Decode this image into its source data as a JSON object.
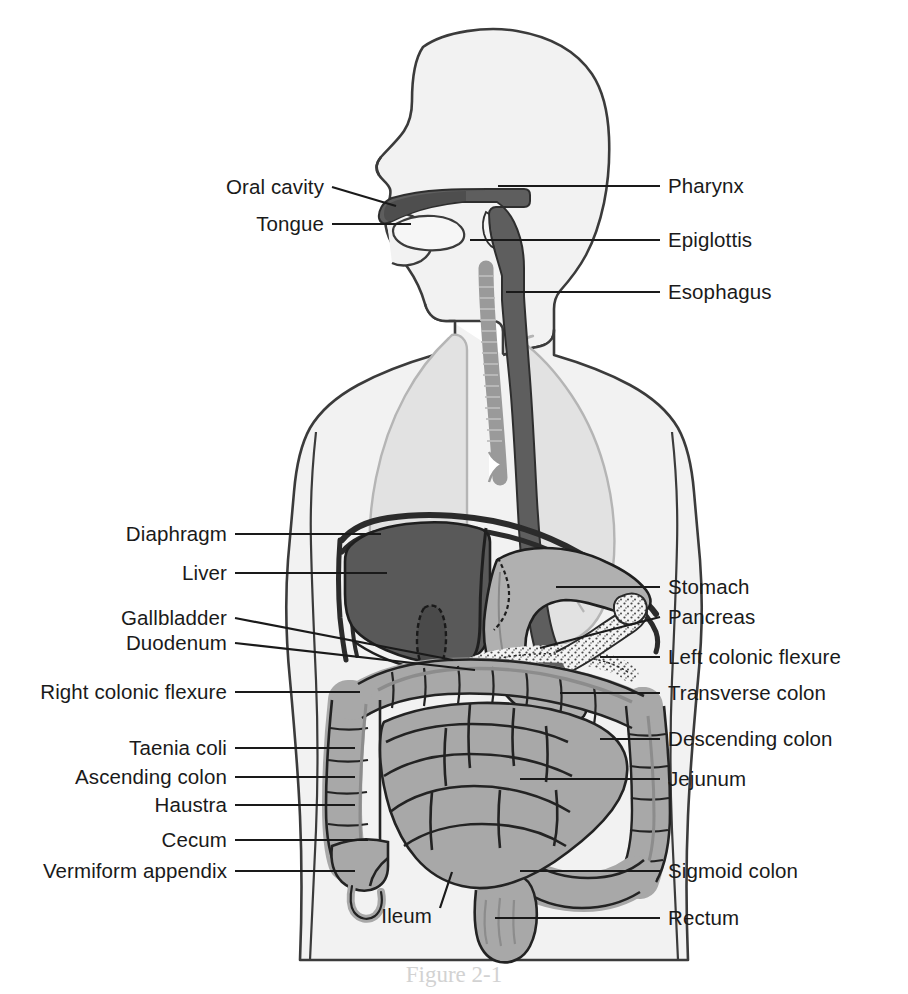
{
  "figure": {
    "caption": "Figure 2-1",
    "colors": {
      "body_fill": "#f2f2f2",
      "body_outline": "#3b3b3b",
      "lung_fill": "#e2e2e2",
      "lung_outline": "#b5b5b5",
      "pharynx_esophagus": "#5e5e5e",
      "liver": "#595959",
      "stomach": "#b0b0b0",
      "intestine": "#a8a8a8",
      "pancreas": "#f0f0f0",
      "leader_line": "#1a1a1a",
      "label_text": "#1a1a1a"
    }
  },
  "labels_left": [
    {
      "id": "oral-cavity",
      "text": "Oral cavity",
      "x": 324,
      "y": 187,
      "tx": 396,
      "ty": 206
    },
    {
      "id": "tongue",
      "text": "Tongue",
      "x": 324,
      "y": 224,
      "tx": 411,
      "ty": 224
    },
    {
      "id": "diaphragm",
      "text": "Diaphragm",
      "x": 227,
      "y": 534,
      "tx": 381,
      "ty": 534
    },
    {
      "id": "liver",
      "text": "Liver",
      "x": 227,
      "y": 573,
      "tx": 387,
      "ty": 573
    },
    {
      "id": "gallbladder",
      "text": "Gallbladder",
      "x": 227,
      "y": 618,
      "tx": 453,
      "ty": 660
    },
    {
      "id": "duodenum",
      "text": "Duodenum",
      "x": 227,
      "y": 643,
      "tx": 475,
      "ty": 670
    },
    {
      "id": "right-colonic-flexure",
      "text": "Right colonic flexure",
      "x": 227,
      "y": 692,
      "tx": 360,
      "ty": 692
    },
    {
      "id": "taenia-coli",
      "text": "Taenia coli",
      "x": 227,
      "y": 748,
      "tx": 355,
      "ty": 748
    },
    {
      "id": "ascending-colon",
      "text": "Ascending colon",
      "x": 227,
      "y": 777,
      "tx": 355,
      "ty": 777
    },
    {
      "id": "haustra",
      "text": "Haustra",
      "x": 227,
      "y": 805,
      "tx": 355,
      "ty": 805
    },
    {
      "id": "cecum",
      "text": "Cecum",
      "x": 227,
      "y": 840,
      "tx": 368,
      "ty": 840
    },
    {
      "id": "vermiform-appendix",
      "text": "Vermiform appendix",
      "x": 227,
      "y": 871,
      "tx": 355,
      "ty": 871
    },
    {
      "id": "ileum",
      "text": "Ileum",
      "x": 432,
      "y": 916,
      "tx": 452,
      "ty": 872
    }
  ],
  "labels_right": [
    {
      "id": "pharynx",
      "text": "Pharynx",
      "x": 668,
      "y": 186,
      "tx": 498,
      "ty": 186
    },
    {
      "id": "epiglottis",
      "text": "Epiglottis",
      "x": 668,
      "y": 240,
      "tx": 470,
      "ty": 240
    },
    {
      "id": "esophagus",
      "text": "Esophagus",
      "x": 668,
      "y": 292,
      "tx": 506,
      "ty": 292
    },
    {
      "id": "stomach",
      "text": "Stomach",
      "x": 668,
      "y": 587,
      "tx": 556,
      "ty": 587
    },
    {
      "id": "pancreas",
      "text": "Pancreas",
      "x": 668,
      "y": 617,
      "tx": 540,
      "ty": 648
    },
    {
      "id": "left-colonic-flexure",
      "text": "Left colonic flexure",
      "x": 668,
      "y": 657,
      "tx": 600,
      "ty": 657
    },
    {
      "id": "transverse-colon",
      "text": "Transverse colon",
      "x": 668,
      "y": 693,
      "tx": 560,
      "ty": 693
    },
    {
      "id": "descending-colon",
      "text": "Descending colon",
      "x": 668,
      "y": 739,
      "tx": 600,
      "ty": 739
    },
    {
      "id": "jejunum",
      "text": "Jejunum",
      "x": 668,
      "y": 779,
      "tx": 520,
      "ty": 779
    },
    {
      "id": "sigmoid-colon",
      "text": "Sigmoid colon",
      "x": 668,
      "y": 871,
      "tx": 520,
      "ty": 871
    },
    {
      "id": "rectum",
      "text": "Rectum",
      "x": 668,
      "y": 918,
      "tx": 495,
      "ty": 918
    }
  ],
  "organs": [
    {
      "id": "head",
      "name": "Head and neck silhouette"
    },
    {
      "id": "torso",
      "name": "Torso silhouette"
    },
    {
      "id": "lung-right",
      "name": "Right lung"
    },
    {
      "id": "lung-left",
      "name": "Left lung"
    },
    {
      "id": "trachea",
      "name": "Trachea"
    },
    {
      "id": "oral-cavity-organ",
      "name": "Oral cavity"
    },
    {
      "id": "tongue-organ",
      "name": "Tongue"
    },
    {
      "id": "pharynx-organ",
      "name": "Pharynx"
    },
    {
      "id": "epiglottis-organ",
      "name": "Epiglottis"
    },
    {
      "id": "esophagus-organ",
      "name": "Esophagus"
    },
    {
      "id": "diaphragm-organ",
      "name": "Diaphragm"
    },
    {
      "id": "liver-organ",
      "name": "Liver"
    },
    {
      "id": "gallbladder-organ",
      "name": "Gallbladder"
    },
    {
      "id": "stomach-organ",
      "name": "Stomach"
    },
    {
      "id": "duodenum-organ",
      "name": "Duodenum"
    },
    {
      "id": "pancreas-organ",
      "name": "Pancreas"
    },
    {
      "id": "colon-organ",
      "name": "Large intestine (colon)"
    },
    {
      "id": "small-intestine",
      "name": "Small intestine"
    },
    {
      "id": "cecum-organ",
      "name": "Cecum"
    },
    {
      "id": "appendix-organ",
      "name": "Vermiform appendix"
    },
    {
      "id": "sigmoid-organ",
      "name": "Sigmoid colon"
    },
    {
      "id": "rectum-organ",
      "name": "Rectum"
    }
  ]
}
